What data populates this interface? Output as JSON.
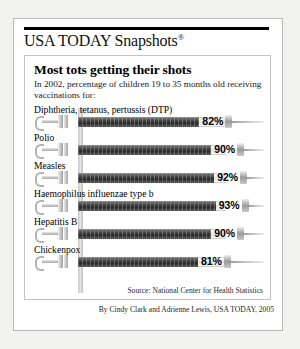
{
  "brand": {
    "title": "USA TODAY Snapshots",
    "registered_mark": "®"
  },
  "headline": "Most tots getting their shots",
  "subhead": "In 2002, percentage of children 19 to 35 months old receiving vaccinations for:",
  "source": "Source: National Center for Health Statistics",
  "byline": "By Cindy Clark and Adrienne Lewis, USA TODAY, 2005",
  "colors": {
    "page_background": "#f2f2f0",
    "panel_background": "#ffffff",
    "frame_border": "#b9b9b9",
    "rule": "#000000",
    "barrel_fill_dark": "#343434",
    "barrel_empty": "#e4e4e4",
    "text": "#000000"
  },
  "chart_data": {
    "type": "bar",
    "title": "Most tots getting their shots",
    "subtitle": "In 2002, percentage of children 19 to 35 months old receiving vaccinations for:",
    "xlabel": "",
    "ylabel": "Percentage of children vaccinated",
    "xlim": [
      0,
      100
    ],
    "grid": false,
    "legend": "none",
    "orientation": "horizontal",
    "units": "%",
    "source": "Source: National Center for Health Statistics",
    "categories": [
      "Diphtheria, tetanus, pertussis (DTP)",
      "Polio",
      "Measles",
      "Haemophilus influenzae type b",
      "Hepatitis B",
      "Chickenpox"
    ],
    "values": [
      82,
      90,
      92,
      93,
      90,
      81
    ],
    "value_labels": [
      "82%",
      "90%",
      "92%",
      "93%",
      "90%",
      "81%"
    ]
  },
  "rows": [
    {
      "label": "Diphtheria, tetanus, pertussis (DTP)",
      "value": 82,
      "value_label": "82%"
    },
    {
      "label": "Polio",
      "value": 90,
      "value_label": "90%"
    },
    {
      "label": "Measles",
      "value": 92,
      "value_label": "92%"
    },
    {
      "label": "Haemophilus influenzae type b",
      "value": 93,
      "value_label": "93%"
    },
    {
      "label": "Hepatitis B",
      "value": 90,
      "value_label": "90%"
    },
    {
      "label": "Chickenpox",
      "value": 81,
      "value_label": "81%"
    }
  ]
}
